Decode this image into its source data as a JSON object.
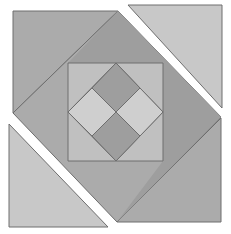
{
  "figure": {
    "width": 231,
    "height": 234,
    "background_color": "#FFFFFF",
    "stroke_color": "#6E6E6E",
    "stroke_width": 1
  },
  "palette": {
    "medium_gray": "#ABABAB",
    "light_gray": "#C8C8C8",
    "dark_gray": "#9E9E9E",
    "pale_gray": "#CFCFCF",
    "white": "#FFFFFF",
    "outline": "#6E6E6E"
  },
  "chart_data": {
    "type": "diagram",
    "layout_hints": {
      "canvas": [
        231,
        234
      ],
      "grid": false,
      "legend": "none",
      "axes": "none",
      "center": [
        117,
        117
      ]
    },
    "shapes": [
      {
        "name": "corner-triangle-top-left",
        "kind": "polygon",
        "fill": "#ABABAB",
        "stroke": "#6E6E6E",
        "points": [
          [
            13,
            11
          ],
          [
            118,
            11
          ],
          [
            13,
            113
          ]
        ]
      },
      {
        "name": "corner-triangle-top-right",
        "kind": "polygon",
        "fill": "#C8C8C8",
        "stroke": "#6E6E6E",
        "points": [
          [
            128,
            5
          ],
          [
            222,
            5
          ],
          [
            222,
            108
          ]
        ]
      },
      {
        "name": "corner-triangle-bottom-left",
        "kind": "polygon",
        "fill": "#C8C8C8",
        "stroke": "#6E6E6E",
        "points": [
          [
            9,
            124
          ],
          [
            9,
            227
          ],
          [
            108,
            227
          ]
        ]
      },
      {
        "name": "corner-triangle-bottom-right",
        "kind": "polygon",
        "fill": "#ABABAB",
        "stroke": "#6E6E6E",
        "points": [
          [
            221,
            118
          ],
          [
            221,
            222
          ],
          [
            117,
            222
          ]
        ]
      },
      {
        "name": "large-rotated-square-left-half",
        "kind": "polygon",
        "fill": "#ABABAB",
        "stroke": "#6E6E6E",
        "points": [
          [
            118,
            11
          ],
          [
            221,
            117
          ],
          [
            117,
            222
          ],
          [
            13,
            113
          ]
        ]
      },
      {
        "name": "large-rotated-square-right-shade",
        "kind": "polygon",
        "fill": "#9E9E9E",
        "stroke": "none",
        "points": [
          [
            118,
            11
          ],
          [
            221,
            117
          ],
          [
            117,
            222
          ],
          [
            163,
            161
          ],
          [
            163,
            63
          ],
          [
            68,
            63
          ]
        ]
      },
      {
        "name": "inner-upright-square",
        "kind": "rect",
        "fill": "#C0C0C0",
        "stroke": "#6E6E6E",
        "points": [
          [
            68,
            63
          ],
          [
            163,
            63
          ],
          [
            163,
            161
          ],
          [
            68,
            161
          ]
        ]
      },
      {
        "name": "inner-rotated-diamond",
        "kind": "polygon",
        "fill": "#CFCFCF",
        "stroke": "#6E6E6E",
        "points": [
          [
            116,
            63
          ],
          [
            163,
            112
          ],
          [
            116,
            161
          ],
          [
            68,
            112
          ]
        ]
      },
      {
        "name": "pinwheel-quadrant-top",
        "kind": "polygon",
        "fill": "#9E9E9E",
        "stroke": "#6E6E6E",
        "points": [
          [
            116,
            63
          ],
          [
            140,
            88
          ],
          [
            116,
            112
          ],
          [
            92,
            88
          ]
        ]
      },
      {
        "name": "pinwheel-quadrant-right",
        "kind": "polygon",
        "fill": "#CFCFCF",
        "stroke": "#6E6E6E",
        "points": [
          [
            140,
            88
          ],
          [
            163,
            112
          ],
          [
            140,
            136
          ],
          [
            116,
            112
          ]
        ]
      },
      {
        "name": "pinwheel-quadrant-bottom",
        "kind": "polygon",
        "fill": "#9E9E9E",
        "stroke": "#6E6E6E",
        "points": [
          [
            116,
            112
          ],
          [
            140,
            136
          ],
          [
            116,
            161
          ],
          [
            92,
            136
          ]
        ]
      },
      {
        "name": "pinwheel-quadrant-left",
        "kind": "polygon",
        "fill": "#CFCFCF",
        "stroke": "#6E6E6E",
        "points": [
          [
            92,
            88
          ],
          [
            116,
            112
          ],
          [
            92,
            136
          ],
          [
            68,
            112
          ]
        ]
      }
    ],
    "region_counts": {
      "corner_triangles": 4,
      "pinwheel_quadrants": 4,
      "nested_squares": 3
    }
  }
}
